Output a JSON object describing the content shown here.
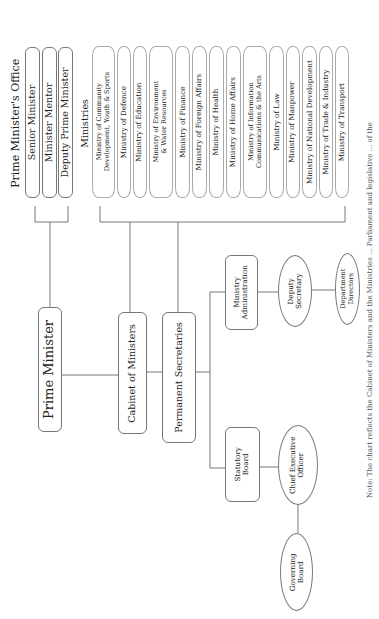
{
  "orientation": "rotated -90deg (text reads bottom-to-top)",
  "prime_ministers_office": {
    "title": "Prime Minister's Office",
    "members": [
      "Senior Minister",
      "Minister Mentor",
      "Deputy Prime Minister"
    ]
  },
  "ministries": {
    "title": "Ministries",
    "items": [
      [
        "Ministry of Community",
        "Development, Youth & Sports"
      ],
      [
        "Ministry of Defence"
      ],
      [
        "Ministry of Education"
      ],
      [
        "Ministry of Environment",
        "& Water Resources"
      ],
      [
        "Ministry of Finance"
      ],
      [
        "Ministry of Foreign Affairs"
      ],
      [
        "Ministry of Health"
      ],
      [
        "Ministry of Home Affairs"
      ],
      [
        "Ministry of Information",
        "Communications & the Arts"
      ],
      [
        "Ministry of Law"
      ],
      [
        "Ministry of Manpower"
      ],
      [
        "Ministry of National Development"
      ],
      [
        "Ministry of Trade & Industry"
      ],
      [
        "Ministry of Transport"
      ]
    ]
  },
  "core": {
    "prime_minister": "Prime Minister",
    "cabinet": "Cabinet of Ministers",
    "permanent_secretaries": "Permanent Secretaries"
  },
  "ministry_branch": {
    "administration": [
      "Ministry",
      "Administration"
    ],
    "deputy_secretary": [
      "Deputy",
      "Secretary"
    ],
    "department_directors": [
      "Department",
      "Directors"
    ]
  },
  "statutory_branch": {
    "statutory_board": [
      "Statutory",
      "Board"
    ],
    "ceo": [
      "Chief Executive",
      "Officer"
    ],
    "governing_board": [
      "Governing",
      "Board"
    ]
  },
  "footnote": "Note: The chart reflects the Cabinet of Ministers and the Ministries ... Parliament and legislative ... of the",
  "colors": {
    "line": "#777777",
    "ministry_border": "#aaaaaa",
    "text": "#222222",
    "background": "#ffffff"
  }
}
